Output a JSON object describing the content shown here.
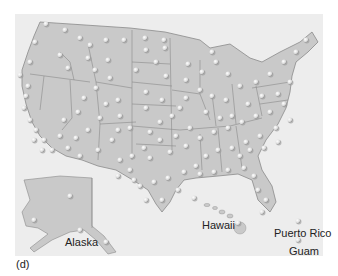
{
  "figure": {
    "panel_label": "(d)",
    "colors": {
      "background": "#ffffff",
      "panel": "#ededed",
      "land": "#c9c9c9",
      "borders": "#8a8a8a",
      "dot": "#f2f2f2",
      "dot_shadow": "#9a9a9a",
      "label_text": "#222222"
    }
  },
  "labels": {
    "alaska": "Alaska",
    "hawaii": "Hawaii",
    "puerto_rico": "Puerto Rico",
    "guam": "Guam"
  },
  "dots": [
    [
      46,
      24
    ],
    [
      35,
      42
    ],
    [
      65,
      30
    ],
    [
      80,
      38
    ],
    [
      90,
      45
    ],
    [
      106,
      40
    ],
    [
      124,
      40
    ],
    [
      145,
      38
    ],
    [
      164,
      40
    ],
    [
      146,
      50
    ],
    [
      165,
      48
    ],
    [
      30,
      62
    ],
    [
      20,
      75
    ],
    [
      28,
      86
    ],
    [
      26,
      96
    ],
    [
      24,
      108
    ],
    [
      30,
      120
    ],
    [
      36,
      130
    ],
    [
      44,
      140
    ],
    [
      52,
      150
    ],
    [
      42,
      150
    ],
    [
      34,
      140
    ],
    [
      60,
      55
    ],
    [
      68,
      68
    ],
    [
      88,
      58
    ],
    [
      95,
      70
    ],
    [
      108,
      60
    ],
    [
      110,
      78
    ],
    [
      96,
      88
    ],
    [
      84,
      98
    ],
    [
      78,
      112
    ],
    [
      64,
      120
    ],
    [
      60,
      136
    ],
    [
      76,
      138
    ],
    [
      88,
      130
    ],
    [
      100,
      118
    ],
    [
      106,
      104
    ],
    [
      118,
      100
    ],
    [
      120,
      116
    ],
    [
      112,
      140
    ],
    [
      98,
      150
    ],
    [
      80,
      156
    ],
    [
      68,
      148
    ],
    [
      136,
      70
    ],
    [
      156,
      62
    ],
    [
      166,
      76
    ],
    [
      146,
      92
    ],
    [
      162,
      100
    ],
    [
      146,
      108
    ],
    [
      160,
      122
    ],
    [
      150,
      132
    ],
    [
      172,
      116
    ],
    [
      180,
      108
    ],
    [
      186,
      80
    ],
    [
      200,
      90
    ],
    [
      188,
      64
    ],
    [
      202,
      72
    ],
    [
      216,
      62
    ],
    [
      212,
      52
    ],
    [
      228,
      74
    ],
    [
      212,
      96
    ],
    [
      226,
      100
    ],
    [
      240,
      86
    ],
    [
      256,
      82
    ],
    [
      270,
      74
    ],
    [
      284,
      62
    ],
    [
      296,
      52
    ],
    [
      306,
      40
    ],
    [
      290,
      82
    ],
    [
      278,
      94
    ],
    [
      262,
      96
    ],
    [
      248,
      104
    ],
    [
      232,
      116
    ],
    [
      220,
      118
    ],
    [
      206,
      112
    ],
    [
      190,
      128
    ],
    [
      176,
      136
    ],
    [
      160,
      140
    ],
    [
      144,
      148
    ],
    [
      132,
      156
    ],
    [
      150,
      158
    ],
    [
      170,
      152
    ],
    [
      186,
      146
    ],
    [
      200,
      138
    ],
    [
      214,
      132
    ],
    [
      228,
      128
    ],
    [
      242,
      122
    ],
    [
      256,
      116
    ],
    [
      270,
      112
    ],
    [
      284,
      104
    ],
    [
      290,
      120
    ],
    [
      276,
      128
    ],
    [
      260,
      136
    ],
    [
      246,
      142
    ],
    [
      232,
      148
    ],
    [
      218,
      150
    ],
    [
      206,
      156
    ],
    [
      196,
      166
    ],
    [
      184,
      172
    ],
    [
      168,
      178
    ],
    [
      154,
      182
    ],
    [
      140,
      186
    ],
    [
      146,
      200
    ],
    [
      162,
      200
    ],
    [
      178,
      190
    ],
    [
      200,
      174
    ],
    [
      214,
      172
    ],
    [
      228,
      170
    ],
    [
      244,
      168
    ],
    [
      254,
      176
    ],
    [
      258,
      190
    ],
    [
      266,
      200
    ],
    [
      262,
      212
    ],
    [
      194,
      198
    ],
    [
      130,
      170
    ],
    [
      120,
      160
    ],
    [
      118,
      176
    ],
    [
      134,
      180
    ],
    [
      240,
      156
    ],
    [
      250,
      150
    ],
    [
      264,
      148
    ],
    [
      278,
      142
    ],
    [
      118,
      130
    ],
    [
      130,
      128
    ],
    [
      186,
      98
    ],
    [
      70,
      196
    ],
    [
      34,
      220
    ],
    [
      80,
      230
    ],
    [
      106,
      242
    ],
    [
      238,
      223
    ],
    [
      298,
      221
    ],
    [
      298,
      240
    ]
  ]
}
